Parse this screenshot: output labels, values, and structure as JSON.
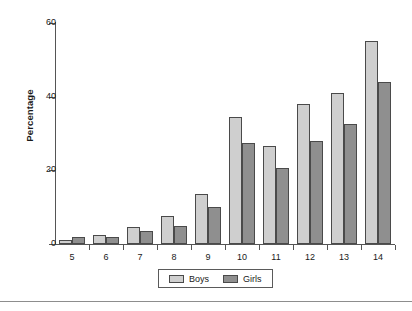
{
  "chart_data": {
    "type": "bar",
    "title": "",
    "subtitle": "",
    "xlabel": "",
    "ylabel": "Percentage",
    "categories": [
      "5",
      "6",
      "7",
      "8",
      "9",
      "10",
      "11",
      "12",
      "13",
      "14"
    ],
    "series": [
      {
        "name": "Boys",
        "color": "#cfcfcf",
        "values": [
          1,
          2.5,
          4.5,
          7.5,
          13.5,
          34.5,
          26.5,
          38,
          41,
          55
        ]
      },
      {
        "name": "Girls",
        "color": "#8f8f8f",
        "values": [
          2,
          2,
          3.5,
          5,
          10,
          27.5,
          20.5,
          28,
          32.5,
          44
        ]
      }
    ],
    "ylim": [
      0,
      60
    ],
    "yticks": [
      0,
      20,
      40,
      60
    ],
    "ytick_labels": [
      "0",
      "20",
      "40",
      "60"
    ],
    "grid": false,
    "legend_position": "bottom-center",
    "legend_entries": [
      "Boys",
      "Girls"
    ]
  },
  "axes": {
    "y_title": "Percentage"
  },
  "legend": {
    "boys_label": "Boys",
    "girls_label": "Girls"
  }
}
